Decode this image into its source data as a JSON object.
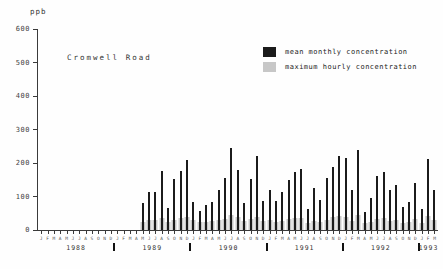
{
  "unit_label": "ppb",
  "site_label": "Cromwell Road",
  "chart_data": {
    "type": "bar",
    "title": "Cromwell Road",
    "ylabel": "ppb",
    "ylim": [
      0,
      600
    ],
    "yticks": [
      600,
      500,
      400,
      300,
      200,
      100,
      0
    ],
    "grid": false,
    "legend_position": "top-right",
    "month_letters": "JFMAMJJASOND",
    "years": [
      {
        "label": "1988",
        "months": 12
      },
      {
        "label": "1989",
        "months": 12
      },
      {
        "label": "1990",
        "months": 12
      },
      {
        "label": "1991",
        "months": 12
      },
      {
        "label": "1992",
        "months": 12
      },
      {
        "label": "1993",
        "months": 3
      }
    ],
    "x_start": "Jan 1988",
    "x_end": "Mar 1993",
    "data_note": "values in ppb; zero means no bar plotted (no data before May 1989)",
    "series": [
      {
        "name": "maximum hourly concentration",
        "color": "#c7c7c7",
        "values": [
          0,
          0,
          0,
          0,
          0,
          0,
          0,
          0,
          0,
          0,
          0,
          0,
          0,
          0,
          0,
          0,
          25,
          30,
          30,
          35,
          25,
          30,
          35,
          40,
          30,
          25,
          25,
          28,
          30,
          32,
          45,
          38,
          28,
          32,
          40,
          28,
          30,
          25,
          28,
          32,
          35,
          35,
          22,
          28,
          25,
          30,
          38,
          42,
          40,
          28,
          45,
          20,
          25,
          32,
          35,
          28,
          30,
          22,
          25,
          32,
          22,
          42,
          30
        ]
      },
      {
        "name": "mean monthly concentration",
        "color": "#1b1b1b",
        "values": [
          0,
          0,
          0,
          0,
          0,
          0,
          0,
          0,
          0,
          0,
          0,
          0,
          0,
          0,
          0,
          0,
          80,
          112,
          113,
          175,
          67,
          151,
          175,
          208,
          83,
          56,
          74,
          83,
          118,
          155,
          244,
          178,
          80,
          153,
          220,
          88,
          118,
          86,
          113,
          148,
          173,
          183,
          63,
          124,
          90,
          156,
          187,
          220,
          215,
          118,
          240,
          55,
          95,
          160,
          172,
          120,
          135,
          70,
          83,
          139,
          64,
          213,
          118
        ]
      }
    ]
  }
}
